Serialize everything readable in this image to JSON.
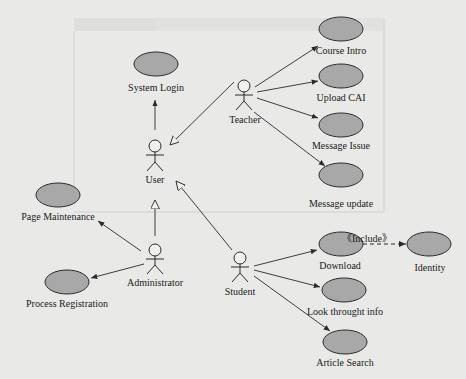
{
  "diagram": {
    "type": "uml-use-case",
    "actors": [
      {
        "id": "user",
        "label": "User"
      },
      {
        "id": "teacher",
        "label": "Teacher"
      },
      {
        "id": "administrator",
        "label": "Administrator"
      },
      {
        "id": "student",
        "label": "Student"
      }
    ],
    "use_cases": [
      {
        "id": "system_login",
        "label": "System Login"
      },
      {
        "id": "course_intro",
        "label": "Course Intro"
      },
      {
        "id": "upload_cai",
        "label": "Upload CAI"
      },
      {
        "id": "message_issue",
        "label": "Message Issue"
      },
      {
        "id": "message_update",
        "label": "Message update"
      },
      {
        "id": "page_maintenance",
        "label": "Page Maintenance"
      },
      {
        "id": "process_registration",
        "label": "Process Registration"
      },
      {
        "id": "download",
        "label": "Download"
      },
      {
        "id": "identity",
        "label": "Identity"
      },
      {
        "id": "look_info",
        "label": "Look throught info"
      },
      {
        "id": "article_search",
        "label": "Article Search"
      }
    ],
    "include_label": "《Include》",
    "colors": {
      "ellipse_fill": "#a8a8a8",
      "stroke": "#2a2a2a",
      "background": "#e9e9e7"
    }
  }
}
